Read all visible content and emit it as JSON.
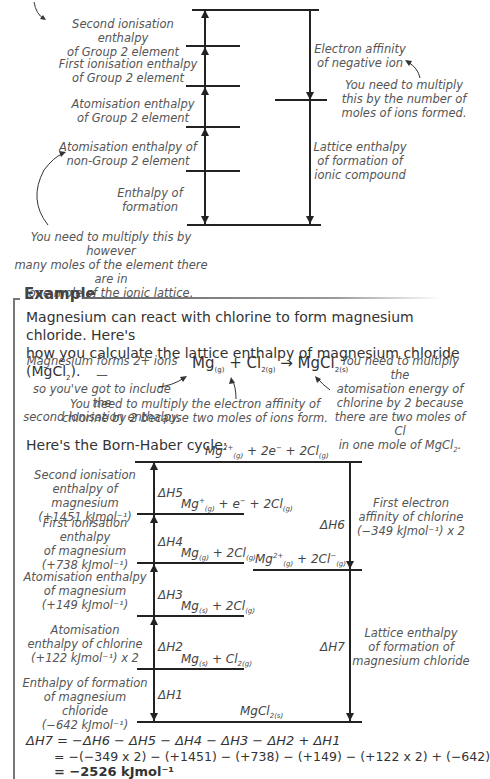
{
  "general_cycle": {
    "labels": {
      "second_ie": [
        "Second ionisation enthalpy",
        "of Group 2 element"
      ],
      "first_ie": [
        "First ionisation enthalpy",
        "of Group 2 element"
      ],
      "atom_g2": [
        "Atomisation enthalpy",
        "of Group 2 element"
      ],
      "atom_nong2": [
        "Atomisation enthalpy of",
        "non-Group 2 element"
      ],
      "formation": [
        "Enthalpy of",
        "formation"
      ],
      "electron_affinity": [
        "Electron affinity",
        "of negative ion"
      ],
      "lattice": [
        "Lattice enthalpy",
        "of formation of",
        "ionic compound"
      ]
    },
    "notes": {
      "ea_note": [
        "You need to multiply",
        "this by the number of",
        "moles of ions formed."
      ],
      "atom_note": [
        "You need to multiply this by however",
        "many moles of the element there are in",
        "one mole of the ionic lattice."
      ]
    }
  },
  "example": {
    "title": "Example",
    "intro": [
      "Magnesium can react with chlorine to form magnesium chloride.  Here's",
      "how you calculate the lattice enthalpy of magnesium chloride (MgCl"
    ],
    "intro_sub": "2",
    "intro_end": ").",
    "equation": {
      "mg": "Mg",
      "mg_state": "(g)",
      "plus": " + ",
      "cl": "Cl",
      "cl_sub": "2(g)",
      "arrow": " → ",
      "product": "MgCl",
      "product_sub": "2(s)"
    },
    "notes": {
      "left": [
        "Magnesium forms 2+ ions —",
        "so you've got to include the",
        "second ionisation enthalpy."
      ],
      "right": [
        "You need to multiply the",
        "atomisation energy of",
        "chlorine by 2 because",
        "there are two moles of Cl",
        "in one mole of MgCl"
      ],
      "right_sub": "2",
      "right_end": ".",
      "bottom": [
        "You need to multiply the electron affinity of",
        "chlorine by 2 because two moles of ions form."
      ]
    },
    "cycle_heading": "Here's the Born-Haber cycle:",
    "cycle": {
      "levels": {
        "top": "Mg²⁺(g) + 2e⁻ + 2Cl(g)",
        "l5": "Mg⁺(g) + e⁻ + 2Cl(g)",
        "l4": "Mg(g) + 2Cl(g)",
        "l4b": "Mg²⁺(g) + 2Cl⁻(g)",
        "l3": "Mg(s) + 2Cl(g)",
        "l2": "Mg(s) + Cl2(g)",
        "bottom": "MgCl2(s)"
      },
      "steps": {
        "dh5": "ΔH5",
        "dh4": "ΔH4",
        "dh3": "ΔH3",
        "dh2": "ΔH2",
        "dh1": "ΔH1",
        "dh6": "ΔH6",
        "dh7": "ΔH7"
      },
      "labels": {
        "second_ie": [
          "Second ionisation",
          "enthalpy of magnesium",
          "(+1451 kJmol⁻¹)"
        ],
        "first_ie": [
          "First ionisation enthalpy",
          "of magnesium",
          "(+738 kJmol⁻¹)"
        ],
        "atom_mg": [
          "Atomisation enthalpy",
          "of magnesium",
          "(+149 kJmol⁻¹)"
        ],
        "atom_cl": [
          "Atomisation",
          "enthalpy of chlorine",
          "(+122 kJmol⁻¹) x 2"
        ],
        "formation": [
          "Enthalpy of formation",
          "of magnesium chloride",
          "(−642 kJmol⁻¹)"
        ],
        "ea": [
          "First electron",
          "affinity of chlorine",
          "(−349 kJmol⁻¹) x 2"
        ],
        "lattice": [
          "Lattice enthalpy",
          "of formation of",
          "magnesium chloride"
        ]
      }
    },
    "calculation": {
      "line1": "ΔH7 = −ΔH6 − ΔH5 − ΔH4 − ΔH3 − ΔH2 + ΔH1",
      "line2": "= −(−349 x 2) − (+1451) − (+738) − (+149) − (+122 x 2) + (−642)",
      "line3": "= −2526 kJmol⁻¹"
    }
  }
}
